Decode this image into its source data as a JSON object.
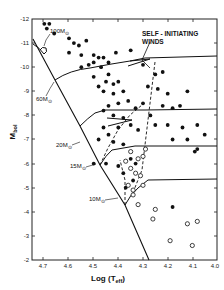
{
  "chart_data": {
    "type": "scatter",
    "title": "",
    "xlabel": "Log (Teff)",
    "xlabel_main": "Log (T",
    "xlabel_sub": "eff",
    "xlabel_close": ")",
    "ylabel_main": "M",
    "ylabel_sub": "bol",
    "xlim": [
      4.75,
      4.0
    ],
    "ylim": [
      -12,
      -2
    ],
    "x_inverted": true,
    "y_inverted": true,
    "grid": false,
    "x_ticks": [
      "4.7",
      "4.6",
      "4.5",
      "4.4",
      "4.3",
      "4.2",
      "4.1",
      "4.0"
    ],
    "x_tick_values": [
      4.7,
      4.6,
      4.5,
      4.4,
      4.3,
      4.2,
      4.1,
      4.0
    ],
    "y_ticks": [
      "-12",
      "-11",
      "-10",
      "-9",
      "-8",
      "-7",
      "-6",
      "-5",
      "-4",
      "-3",
      "-2"
    ],
    "y_tick_values": [
      -12,
      -11,
      -10,
      -9,
      -8,
      -7,
      -6,
      -5,
      -4,
      -3,
      -2
    ],
    "annotations": [
      {
        "text": "100M⊙",
        "label": "100M",
        "sub": "⊙"
      },
      {
        "text": "60M⊙",
        "label": "60M",
        "sub": "⊙"
      },
      {
        "text": "20M⊙",
        "label": "20M",
        "sub": "⊙"
      },
      {
        "text": "15M⊙",
        "label": "15M",
        "sub": "⊙"
      },
      {
        "text": "10M⊙",
        "label": "10M",
        "sub": "⊙"
      },
      {
        "text": "SELF-INITIATING WINDS",
        "line1": "SELF - INITIATING",
        "line2": "WINDS"
      }
    ],
    "series": [
      {
        "name": "filled circles (observed stars)",
        "marker": "filled-circle",
        "points": [
          [
            4.7,
            -11.8
          ],
          [
            4.68,
            -11.8
          ],
          [
            4.69,
            -11.6
          ],
          [
            4.66,
            -11.4
          ],
          [
            4.6,
            -11.2
          ],
          [
            4.58,
            -11.0
          ],
          [
            4.56,
            -10.9
          ],
          [
            4.53,
            -11.1
          ],
          [
            4.6,
            -10.6
          ],
          [
            4.55,
            -10.5
          ],
          [
            4.5,
            -10.5
          ],
          [
            4.48,
            -10.4
          ],
          [
            4.46,
            -10.4
          ],
          [
            4.44,
            -10.2
          ],
          [
            4.41,
            -10.6
          ],
          [
            4.35,
            -10.7
          ],
          [
            4.5,
            -10.2
          ],
          [
            4.52,
            -10.1
          ],
          [
            4.55,
            -10.0
          ],
          [
            4.47,
            -10.0
          ],
          [
            4.44,
            -9.7
          ],
          [
            4.5,
            -9.6
          ],
          [
            4.45,
            -9.4
          ],
          [
            4.42,
            -9.3
          ],
          [
            4.4,
            -9.4
          ],
          [
            4.48,
            -9.2
          ],
          [
            4.46,
            -9.0
          ],
          [
            4.42,
            -8.9
          ],
          [
            4.38,
            -9.0
          ],
          [
            4.36,
            -8.6
          ],
          [
            4.4,
            -8.5
          ],
          [
            4.44,
            -8.4
          ],
          [
            4.46,
            -8.2
          ],
          [
            4.42,
            -8.0
          ],
          [
            4.38,
            -7.9
          ],
          [
            4.35,
            -7.6
          ],
          [
            4.32,
            -7.4
          ],
          [
            4.4,
            -7.5
          ],
          [
            4.44,
            -7.2
          ],
          [
            4.46,
            -7.5
          ],
          [
            4.48,
            -7.0
          ],
          [
            4.42,
            -6.9
          ],
          [
            4.38,
            -6.8
          ],
          [
            4.3,
            -10.1
          ],
          [
            4.25,
            -9.7
          ],
          [
            4.22,
            -9.8
          ],
          [
            4.28,
            -9.2
          ],
          [
            4.24,
            -9.1
          ],
          [
            4.2,
            -8.9
          ],
          [
            4.12,
            -9.0
          ],
          [
            4.22,
            -8.4
          ],
          [
            4.18,
            -8.3
          ],
          [
            4.15,
            -8.4
          ],
          [
            4.3,
            -8.5
          ],
          [
            4.33,
            -8.3
          ],
          [
            4.27,
            -8.0
          ],
          [
            4.25,
            -7.6
          ],
          [
            4.2,
            -7.6
          ],
          [
            4.14,
            -7.5
          ],
          [
            4.08,
            -7.6
          ],
          [
            4.05,
            -7.2
          ],
          [
            4.18,
            -7.0
          ],
          [
            4.12,
            -7.0
          ],
          [
            4.08,
            -6.6
          ],
          [
            4.35,
            -6.2
          ],
          [
            4.33,
            -6.0
          ],
          [
            4.38,
            -5.6
          ],
          [
            4.4,
            -5.9
          ],
          [
            4.45,
            -6.0
          ],
          [
            4.5,
            -6.0
          ],
          [
            4.34,
            -5.3
          ],
          [
            4.37,
            -5.0
          ],
          [
            4.18,
            -4.2
          ],
          [
            4.09,
            -6.5
          ]
        ]
      },
      {
        "name": "open circles (observed stars)",
        "marker": "open-circle",
        "points": [
          [
            4.35,
            -5.8
          ],
          [
            4.33,
            -5.6
          ],
          [
            4.31,
            -5.5
          ],
          [
            4.3,
            -5.1
          ],
          [
            4.34,
            -4.9
          ],
          [
            4.36,
            -5.1
          ],
          [
            4.34,
            -4.7
          ],
          [
            4.32,
            -4.3
          ],
          [
            4.25,
            -4.1
          ],
          [
            4.26,
            -3.7
          ],
          [
            4.12,
            -3.5
          ],
          [
            4.08,
            -3.6
          ],
          [
            4.19,
            -2.8
          ],
          [
            4.1,
            -2.6
          ],
          [
            4.3,
            -6.3
          ],
          [
            4.29,
            -6.6
          ],
          [
            4.32,
            -6.2
          ],
          [
            4.35,
            -6.5
          ],
          [
            4.37,
            -6.1
          ]
        ]
      }
    ],
    "lines": [
      {
        "name": "ZAMS",
        "style": "solid"
      },
      {
        "name": "100M track",
        "style": "solid"
      },
      {
        "name": "60M track",
        "style": "solid"
      },
      {
        "name": "20M track",
        "style": "solid"
      },
      {
        "name": "15M track",
        "style": "solid"
      },
      {
        "name": "10M track",
        "style": "solid"
      },
      {
        "name": "self-initiating winds boundary",
        "style": "dashed"
      }
    ]
  }
}
